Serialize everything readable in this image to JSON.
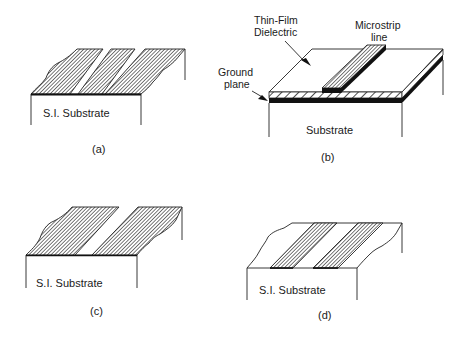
{
  "figure": {
    "panels": [
      {
        "id": "a",
        "caption": "(a)",
        "substrate_label": "S.I. Substrate",
        "description": "Coplanar waveguide: three metal strips (two ground planes and center conductor) on semi-insulating substrate"
      },
      {
        "id": "b",
        "caption": "(b)",
        "substrate_label": "Substrate",
        "annotations": {
          "dielectric": "Thin-Film\nDielectric",
          "dielectric_line1": "Thin-Film",
          "dielectric_line2": "Dielectric",
          "strip_line1": "Microstrip",
          "strip_line2": "line",
          "ground_line1": "Ground",
          "ground_line2": "plane"
        },
        "description": "Thin-film microstrip: microstrip line on thin-film dielectric above ground plane on substrate"
      },
      {
        "id": "c",
        "caption": "(c)",
        "substrate_label": "S.I. Substrate",
        "description": "Slotline: two metal planes separated by a slot on semi-insulating substrate"
      },
      {
        "id": "d",
        "caption": "(d)",
        "substrate_label": "S.I. Substrate",
        "description": "Coplanar strips: two parallel metal strips on semi-insulating substrate"
      }
    ],
    "colors": {
      "line": "#222222",
      "background": "#ffffff",
      "ground_fill": "#111111"
    }
  }
}
